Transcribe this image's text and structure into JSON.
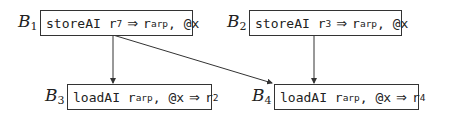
{
  "diagram": {
    "type": "control-flow-graph",
    "blocks": [
      {
        "id": "B1",
        "name": "B",
        "sub": "1",
        "op": "storeAI",
        "parts": [
          "r",
          "7",
          "⇒",
          "r",
          "arp",
          ", @x"
        ]
      },
      {
        "id": "B2",
        "name": "B",
        "sub": "2",
        "op": "storeAI",
        "parts": [
          "r",
          "3",
          "⇒",
          "r",
          "arp",
          ", @x"
        ]
      },
      {
        "id": "B3",
        "name": "B",
        "sub": "3",
        "op": "loadAI",
        "parts": [
          "r",
          "arp",
          ", @x",
          "⇒",
          "r",
          "2"
        ]
      },
      {
        "id": "B4",
        "name": "B",
        "sub": "4",
        "op": "loadAI",
        "parts": [
          "r",
          "arp",
          ", @x",
          "⇒",
          "r",
          "4"
        ]
      }
    ],
    "edges": [
      {
        "from": "B1",
        "to": "B3"
      },
      {
        "from": "B1",
        "to": "B4"
      },
      {
        "from": "B2",
        "to": "B4"
      }
    ],
    "colors": {
      "stroke": "#333333",
      "text": "#222222",
      "background": "#ffffff"
    }
  }
}
